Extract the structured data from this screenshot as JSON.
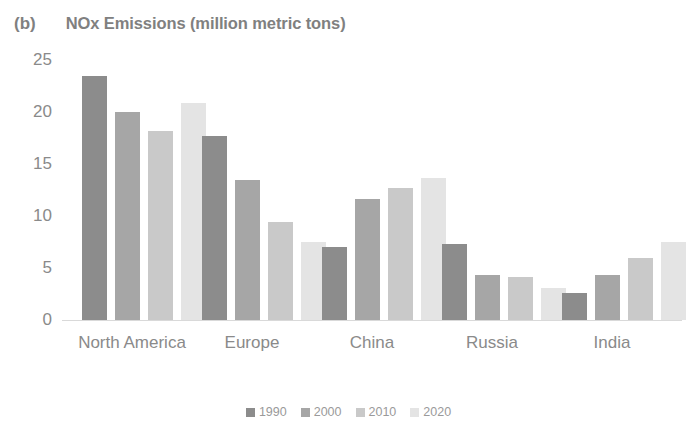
{
  "chart_data": {
    "type": "bar",
    "title": "NOx Emissions (million metric tons)",
    "panel_tag": "(b)",
    "xlabel": "",
    "ylabel": "",
    "ylim": [
      0,
      25
    ],
    "yticks": [
      25,
      20,
      15,
      10,
      5,
      0
    ],
    "grid": false,
    "legend_position": "bottom",
    "categories": [
      "North America",
      "Europe",
      "China",
      "Russia",
      "India"
    ],
    "series": [
      {
        "name": "1990",
        "color": "#8c8c8c",
        "values": [
          23.5,
          17.7,
          7.0,
          7.3,
          2.6
        ]
      },
      {
        "name": "2000",
        "color": "#a6a6a6",
        "values": [
          20.0,
          13.5,
          11.6,
          4.3,
          4.3
        ]
      },
      {
        "name": "2010",
        "color": "#c9c9c9",
        "values": [
          18.2,
          9.4,
          12.7,
          4.1,
          6.0
        ]
      },
      {
        "name": "2020",
        "color": "#e4e4e4",
        "values": [
          20.9,
          7.5,
          13.7,
          3.1,
          7.5
        ]
      }
    ]
  }
}
